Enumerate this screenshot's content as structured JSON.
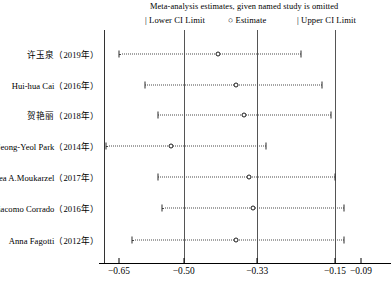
{
  "header": {
    "title": "Meta-analysis estimates, given named study is omitted",
    "legend": [
      {
        "glyph": "|",
        "label": "Lower CI Limit",
        "icon": "vertical-bar-icon"
      },
      {
        "glyph": "○",
        "label": "Estimate",
        "icon": "open-circle-icon"
      },
      {
        "glyph": "|",
        "label": "Upper CI Limit",
        "icon": "vertical-bar-icon"
      }
    ]
  },
  "axis": {
    "ticks": [
      {
        "label": "−0.65",
        "value": -0.65
      },
      {
        "label": "−0.50",
        "value": -0.5
      },
      {
        "label": "−0.33",
        "value": -0.33
      },
      {
        "label": "−0.15",
        "value": -0.15
      },
      {
        "label": "−0.09",
        "value": -0.09
      }
    ],
    "reference_lines": [
      -0.5,
      -0.33,
      -0.15
    ],
    "xmin": -0.65,
    "xmax": -0.09
  },
  "chart_data": {
    "type": "forest",
    "title": "Meta-analysis estimates, given named study is omitted",
    "xlabel": "",
    "ylabel": "",
    "xlim": [
      -0.65,
      -0.09
    ],
    "grid": false,
    "legend_position": "top",
    "categories": [
      "许玉泉（2019年）",
      "Hui-hua Cai（2016年）",
      "贺艳丽（2018年）",
      "Jeong-Yeol Park（2014年）",
      "Lea A.Moukarzel（2017年）",
      "Giacomo Corrado（2016年）",
      "Anna Fagotti（2012年）"
    ],
    "points": [
      {
        "study": "许玉泉（2019年）",
        "estimate": -0.42,
        "lower": -0.65,
        "upper": -0.23
      },
      {
        "study": "Hui-hua Cai（2016年）",
        "estimate": -0.38,
        "lower": -0.59,
        "upper": -0.18
      },
      {
        "study": "贺艳丽（2018年）",
        "estimate": -0.36,
        "lower": -0.56,
        "upper": -0.16
      },
      {
        "study": "Jeong-Yeol Park（2014年）",
        "estimate": -0.53,
        "lower": -0.68,
        "upper": -0.31
      },
      {
        "study": "Lea A.Moukarzel（2017年）",
        "estimate": -0.35,
        "lower": -0.56,
        "upper": -0.15
      },
      {
        "study": "Giacomo Corrado（2016年）",
        "estimate": -0.34,
        "lower": -0.55,
        "upper": -0.13
      },
      {
        "study": "Anna Fagotti（2012年）",
        "estimate": -0.38,
        "lower": -0.62,
        "upper": -0.13
      }
    ],
    "marker": "open-circle",
    "whisker_style": "dotted"
  }
}
